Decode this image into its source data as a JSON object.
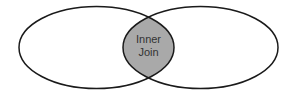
{
  "diagram": {
    "type": "venn",
    "sets": [
      {
        "name": "left-set",
        "label": ""
      },
      {
        "name": "right-set",
        "label": ""
      }
    ],
    "intersection": {
      "label_line1": "Inner",
      "label_line2": "Join",
      "fill_color": "#a9a9a9"
    },
    "stroke_color": "#1a1a1a",
    "text_color": "#333333",
    "background_color": "#ffffff"
  }
}
